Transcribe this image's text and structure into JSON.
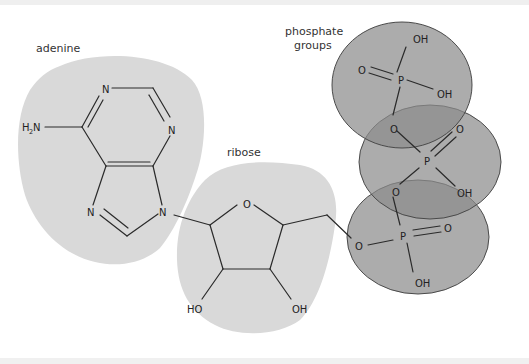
{
  "diagram": {
    "labels": {
      "adenine": "adenine",
      "ribose": "ribose",
      "phosphate_line1": "phosphate",
      "phosphate_line2": "groups"
    },
    "adenine_atoms": {
      "amine_h": "H",
      "amine_sub": "2",
      "amine_n": "N",
      "n1": "N",
      "n3": "N",
      "n7": "N",
      "n9": "N"
    },
    "ribose_atoms": {
      "ring_o": "O",
      "ho_left": "HO",
      "oh_right": "OH"
    },
    "phosphate_atoms": {
      "p1": {
        "p": "P",
        "o_double": "O",
        "oh_top": "OH",
        "oh_right": "OH",
        "o_bridge": "O"
      },
      "p2": {
        "p": "P",
        "o_double": "O",
        "oh": "OH",
        "o_bridge": "O"
      },
      "p3": {
        "p": "P",
        "o_double": "O",
        "oh": "OH",
        "o_ester": "O"
      }
    },
    "colors": {
      "base_blob": "#d9d9d9",
      "sugar_blob": "#d9d9d9",
      "phosphate_fill": "#8c8c8c",
      "phosphate_stroke": "#4a4a4a",
      "bond": "#2a2a2a"
    }
  }
}
